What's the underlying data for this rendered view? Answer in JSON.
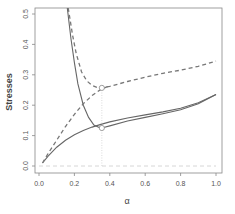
{
  "chart_data": {
    "type": "line",
    "title": "",
    "xlabel": "α",
    "ylabel": "Stresses",
    "xlim": [
      0.0,
      1.0
    ],
    "ylim": [
      0.0,
      0.5
    ],
    "xticks": [
      "0.0",
      "0.2",
      "0.4",
      "0.6",
      "0.8",
      "1.0"
    ],
    "yticks": [
      "0.0",
      "0.1",
      "0.2",
      "0.3",
      "0.4",
      "0.5"
    ],
    "grid": false,
    "legend": null,
    "series": [
      {
        "name": "solid-decreasing",
        "style": "solid",
        "x": [
          0.16,
          0.18,
          0.2,
          0.22,
          0.25,
          0.28,
          0.31,
          0.34,
          0.355,
          0.4,
          0.5,
          0.6,
          0.7,
          0.8,
          0.9,
          1.0
        ],
        "y": [
          0.52,
          0.42,
          0.34,
          0.27,
          0.2,
          0.16,
          0.135,
          0.127,
          0.125,
          0.132,
          0.148,
          0.16,
          0.172,
          0.185,
          0.205,
          0.235
        ]
      },
      {
        "name": "solid-increasing",
        "style": "solid",
        "x": [
          0.02,
          0.05,
          0.1,
          0.15,
          0.2,
          0.25,
          0.3,
          0.35,
          0.4,
          0.5,
          0.6,
          0.7,
          0.8,
          0.9,
          1.0
        ],
        "y": [
          0.01,
          0.032,
          0.062,
          0.085,
          0.103,
          0.117,
          0.128,
          0.137,
          0.145,
          0.158,
          0.168,
          0.178,
          0.19,
          0.208,
          0.235
        ]
      },
      {
        "name": "dashed-decreasing",
        "style": "dashed",
        "x": [
          0.165,
          0.19,
          0.21,
          0.24,
          0.27,
          0.3,
          0.33,
          0.355,
          0.4,
          0.5,
          0.6,
          0.7,
          0.8,
          0.9,
          1.0
        ],
        "y": [
          0.52,
          0.43,
          0.37,
          0.31,
          0.28,
          0.265,
          0.258,
          0.257,
          0.262,
          0.278,
          0.292,
          0.305,
          0.315,
          0.328,
          0.345
        ]
      },
      {
        "name": "dashed-increasing",
        "style": "dashed",
        "x": [
          0.02,
          0.05,
          0.1,
          0.15,
          0.2,
          0.25,
          0.3,
          0.35,
          0.39
        ],
        "y": [
          0.01,
          0.04,
          0.085,
          0.13,
          0.17,
          0.205,
          0.232,
          0.252,
          0.262
        ]
      },
      {
        "name": "zero-reference",
        "style": "dashed-light",
        "x": [
          0.0,
          1.0
        ],
        "y": [
          0.0,
          0.0
        ]
      }
    ],
    "annotations": [
      {
        "type": "circle-marker",
        "x": 0.355,
        "y": 0.257
      },
      {
        "type": "circle-marker",
        "x": 0.355,
        "y": 0.125
      },
      {
        "type": "vertical-dotted-line",
        "x": 0.355,
        "y_from": 0.0,
        "y_to": 0.257
      }
    ]
  }
}
